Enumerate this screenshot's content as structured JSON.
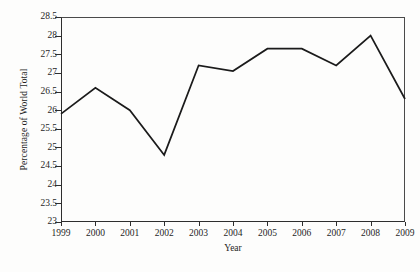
{
  "chart_data": {
    "type": "line",
    "title": "",
    "xlabel": "Year",
    "ylabel": "Percentage of World Total",
    "categories": [
      "1999",
      "2000",
      "2001",
      "2002",
      "2003",
      "2004",
      "2005",
      "2006",
      "2007",
      "2008",
      "2009"
    ],
    "x": [
      1999,
      2000,
      2001,
      2002,
      2003,
      2004,
      2005,
      2006,
      2007,
      2008,
      2009
    ],
    "values": [
      25.9,
      26.6,
      26.0,
      24.8,
      27.2,
      27.05,
      27.65,
      27.65,
      27.2,
      28.0,
      26.3
    ],
    "series": [
      {
        "name": "Percentage of World Total",
        "values": [
          25.9,
          26.6,
          26.0,
          24.8,
          27.2,
          27.05,
          27.65,
          27.65,
          27.2,
          28.0,
          26.3
        ]
      }
    ],
    "ylim": [
      23,
      28.5
    ],
    "xlim": [
      1999,
      2009
    ],
    "ytick_labels": [
      "28.5",
      "28",
      "27.5",
      "27",
      "26.5",
      "26",
      "25.5",
      "25",
      "24.5",
      "24",
      "23.5",
      "23"
    ],
    "ytick_values": [
      28.5,
      28,
      27.5,
      27,
      26.5,
      26,
      25.5,
      25,
      24.5,
      24,
      23.5,
      23
    ],
    "ytick_step": 0.5,
    "grid": false,
    "legend": false,
    "legend_position": "none",
    "line_color": "#1b1b1b",
    "axis_color": "#2e2e2e",
    "background_color": "#fdfdfc",
    "markers": false,
    "annotations": []
  },
  "caption": {
    "sliver_text": ""
  }
}
